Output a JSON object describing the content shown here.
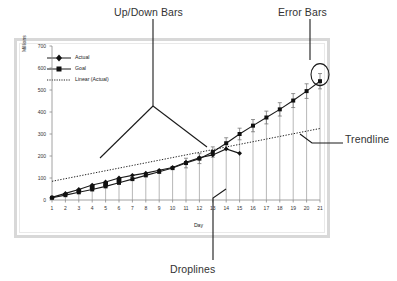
{
  "annotations": [
    {
      "id": "updown",
      "label": "Up/Down Bars"
    },
    {
      "id": "error",
      "label": "Error Bars"
    },
    {
      "id": "trendline",
      "label": "Trendline"
    },
    {
      "id": "droplines",
      "label": "Droplines"
    }
  ],
  "annotation_labels": {
    "up_down_bars": "Up/Down Bars",
    "error_bars": "Error Bars",
    "trendline": "Trendline",
    "droplines": "Droplines"
  },
  "colors": {
    "series_line": "#1a1a1a",
    "updown_bar": "#111111",
    "dropline": "#9a9a9a",
    "error_bar": "#777777",
    "trendline": "#222222",
    "frame": "#d8d8d8",
    "axis": "#808080",
    "annotation_text": "#333333",
    "background": "#ffffff"
  },
  "chart_data": {
    "type": "line",
    "title": "",
    "xlabel": "Day",
    "ylabel": "Millions",
    "x": [
      1,
      2,
      3,
      4,
      5,
      6,
      7,
      8,
      9,
      10,
      11,
      12,
      13,
      14,
      15,
      16,
      17,
      18,
      19,
      20,
      21
    ],
    "categories": [
      "1",
      "2",
      "3",
      "4",
      "5",
      "6",
      "7",
      "8",
      "9",
      "10",
      "11",
      "12",
      "13",
      "14",
      "15",
      "16",
      "17",
      "18",
      "19",
      "20",
      "21"
    ],
    "xlim": [
      1,
      21
    ],
    "ylim": [
      0,
      700
    ],
    "yticks": [
      0,
      100,
      200,
      300,
      400,
      500,
      600,
      700
    ],
    "xticks": [
      "1",
      "2",
      "3",
      "4",
      "5",
      "6",
      "7",
      "8",
      "9",
      "10",
      "11",
      "12",
      "13",
      "14",
      "15",
      "16",
      "17",
      "18",
      "19",
      "20",
      "21"
    ],
    "grid": false,
    "legend_position": "upper-left",
    "series": [
      {
        "name": "Actual",
        "marker": "diamond",
        "values": [
          12,
          30,
          48,
          68,
          82,
          100,
          112,
          122,
          135,
          148,
          172,
          192,
          205,
          232,
          212,
          null,
          null,
          null,
          null,
          null,
          null
        ]
      },
      {
        "name": "Goal",
        "marker": "square",
        "values": [
          10,
          22,
          35,
          48,
          62,
          78,
          95,
          112,
          128,
          145,
          168,
          188,
          218,
          258,
          300,
          338,
          375,
          412,
          452,
          495,
          540
        ]
      },
      {
        "name": "Linear (Actual)",
        "marker": "none",
        "style": "dotted",
        "values": [
          85,
          97,
          109,
          121,
          133,
          145,
          157,
          169,
          181,
          193,
          205,
          217,
          229,
          241,
          253,
          265,
          277,
          289,
          301,
          313,
          325
        ]
      }
    ],
    "legend_entries": [
      "Actual",
      "Goal",
      "Linear (Actual)"
    ],
    "features": {
      "up_down_bars_range": [
        1,
        6
      ],
      "droplines_range": [
        1,
        21
      ],
      "error_bars_range": [
        11,
        21
      ],
      "highlighted_point": {
        "x": 21,
        "y": 570,
        "series": "Goal"
      }
    }
  }
}
